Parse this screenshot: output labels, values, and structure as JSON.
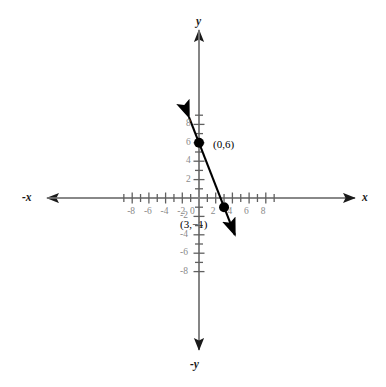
{
  "chart_data": {
    "type": "line",
    "title": "",
    "xlabel": "x",
    "ylabel": "y",
    "axis_labels": {
      "x_positive": "x",
      "x_negative": "-x",
      "y_positive": "y",
      "y_negative": "-y"
    },
    "xlim": [
      -9.5,
      10
    ],
    "ylim": [
      -9.5,
      10
    ],
    "grid": false,
    "legend": null,
    "x_ticks": [
      -8,
      -6,
      -4,
      -2,
      0,
      2,
      4,
      6,
      8
    ],
    "x_tick_labels": [
      "-8",
      "-6",
      "-4",
      "-2",
      "0",
      "2",
      "4",
      "6",
      "8"
    ],
    "y_ticks": [
      8,
      6,
      4,
      2,
      -2,
      -4,
      -6,
      -8
    ],
    "y_tick_labels": [
      "8",
      "6",
      "4",
      "2",
      "-2",
      "-4",
      "-6",
      "-8"
    ],
    "minor_tick_interval": 1,
    "series": [
      {
        "name": "line",
        "slope": -2.3333,
        "intercept": 6,
        "equation": "y = -7/3 x + 6",
        "x": [
          -1.2,
          4.3
        ],
        "y": [
          8.8,
          -4.0
        ],
        "arrow_start": true,
        "arrow_end": true,
        "color": "#000000"
      }
    ],
    "points": [
      {
        "label": "(0,6)",
        "x": 0,
        "y": 6,
        "label_dx": 14,
        "label_dy": -4
      },
      {
        "label": "(3,−1)",
        "x": 3,
        "y": -1,
        "label_dx": -44,
        "label_dy": 12
      }
    ],
    "colors": {
      "axis": "#808080",
      "arrow": "#1a1a1a",
      "tick_label": "#8a8a8a",
      "line": "#000000",
      "point": "#000000",
      "background": "#ffffff"
    }
  }
}
